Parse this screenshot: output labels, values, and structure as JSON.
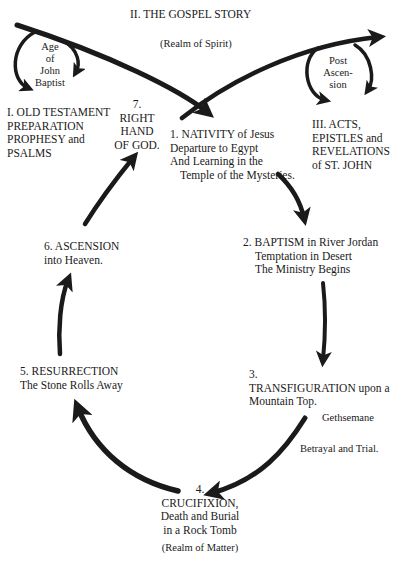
{
  "title": "II. THE GOSPEL STORY",
  "realm_top": "(Realm of Spirit)",
  "realm_bottom": "(Realm of Matter)",
  "age_john": [
    "Age",
    "of",
    "John",
    "Baptist"
  ],
  "old_testament": [
    "I. OLD TESTAMENT",
    "PREPARATION",
    "PROPHESY and",
    "PSALMS"
  ],
  "right_hand": [
    "7.",
    "RIGHT",
    "HAND",
    "OF GOD."
  ],
  "post_ascension": [
    "Post",
    "Ascen-",
    "sion"
  ],
  "acts": [
    "III. ACTS,",
    "EPISTLES and",
    "REVELATIONS",
    "of ST. JOHN"
  ],
  "nativity": [
    "1. NATIVITY of Jesus",
    "Departure to Egypt",
    "And Learning in the",
    "Temple of the Mysteries."
  ],
  "baptism": [
    "2. BAPTISM in River Jordan",
    "Temptation in Desert",
    "The Ministry Begins"
  ],
  "transfiguration": [
    "3.",
    "TRANSFIGURATION upon a",
    "Mountain Top."
  ],
  "gethsemane": "Gethsemane",
  "betrayal": "Betrayal and Trial.",
  "crucifixion": [
    "4.",
    "CRUCIFIXION,",
    "Death and Burial",
    "in a Rock Tomb"
  ],
  "resurrection": [
    "5. RESURRECTION",
    "The Stone Rolls Away"
  ],
  "ascension": [
    "6. ASCENSION",
    "into Heaven."
  ],
  "colors": {
    "ink": "#1a1a1a",
    "background": "#ffffff"
  }
}
